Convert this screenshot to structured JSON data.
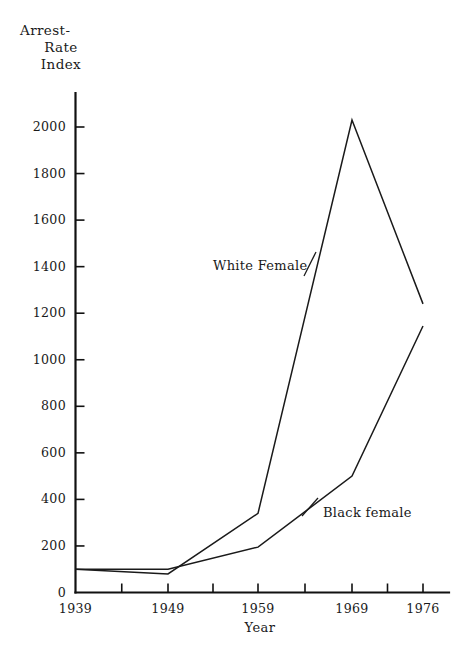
{
  "figure": {
    "scan_artifact_text": "",
    "background_color": "#ffffff",
    "ink_color": "#1a1a1a"
  },
  "chart_data": {
    "type": "line",
    "title": "",
    "xlabel": "Year",
    "ylabel": "Arrest-\nRate\nIndex",
    "ylabel_lines": [
      "Arrest-",
      "Rate",
      "Index"
    ],
    "x": [
      1939,
      1949,
      1959,
      1969,
      1976
    ],
    "categories": [
      "1939",
      "1949",
      "1959",
      "1969",
      "1976"
    ],
    "xtick_labels": [
      "1939",
      "1949",
      "1959",
      "1969",
      "1976"
    ],
    "ytick_labels": [
      "0",
      "200",
      "400",
      "600",
      "800",
      "1000",
      "1200",
      "1400",
      "1600",
      "1800",
      "2000"
    ],
    "yticks": [
      0,
      200,
      400,
      600,
      800,
      1000,
      1200,
      1400,
      1600,
      1800,
      2000
    ],
    "ylim": [
      0,
      2120
    ],
    "xlim": [
      1939,
      1976
    ],
    "grid": false,
    "legend_position": "inline-annotation",
    "minor_xticks": true,
    "series": [
      {
        "name": "White Female",
        "label": "White Female",
        "values": [
          100,
          80,
          340,
          2030,
          1240
        ],
        "color": "#1a1a1a"
      },
      {
        "name": "Black female",
        "label": "Black female",
        "values": [
          100,
          100,
          195,
          500,
          1145
        ],
        "color": "#1a1a1a"
      }
    ],
    "annotations": [
      {
        "text": "White Female",
        "series": "White Female"
      },
      {
        "text": "Black female",
        "series": "Black female"
      }
    ]
  }
}
